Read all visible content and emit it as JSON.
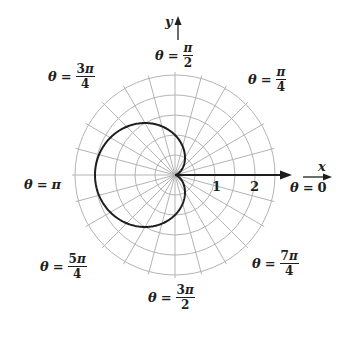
{
  "chart_data": {
    "type": "polar",
    "title": "",
    "equation": "r = 1 - cos(θ)",
    "curve": "cardioid",
    "center_px": [
      175,
      175
    ],
    "scale_px_per_unit": 40,
    "grid": {
      "rings_r": [
        0.5,
        1.0,
        1.5,
        2.0,
        2.5
      ],
      "spoke_step_deg": 15,
      "color": "#b4b4b4"
    },
    "radial_tick_labels": [
      {
        "value": 1,
        "text": "1"
      },
      {
        "value": 2,
        "text": "2"
      }
    ],
    "axes": {
      "x_label": "x",
      "y_label": "y"
    },
    "points": [
      {
        "theta": "0",
        "r": 0
      },
      {
        "theta": "π/2",
        "r": 1
      },
      {
        "theta": "π",
        "r": 2
      },
      {
        "theta": "3π/2",
        "r": 1
      },
      {
        "theta": "2π",
        "r": 0
      }
    ],
    "angle_labels": [
      {
        "id": "t0",
        "angle": "0"
      },
      {
        "id": "t45",
        "angle": "π/4"
      },
      {
        "id": "t90",
        "angle": "π/2"
      },
      {
        "id": "t135",
        "angle": "3π/4"
      },
      {
        "id": "t180",
        "angle": "π"
      },
      {
        "id": "t225",
        "angle": "5π/4"
      },
      {
        "id": "t270",
        "angle": "3π/2"
      },
      {
        "id": "t315",
        "angle": "7π/4"
      }
    ],
    "colors": {
      "curve": "#1e1e1e",
      "axis": "#1e1e1e",
      "grid": "#b4b4b4"
    }
  },
  "labels": {
    "theta": "θ",
    "eq": "=",
    "pi": "π",
    "t0": {
      "value": "0"
    },
    "t45": {
      "num_coef": "",
      "den": "4"
    },
    "t90": {
      "num_coef": "",
      "den": "2"
    },
    "t135": {
      "num_coef": "3",
      "den": "4"
    },
    "t180": {
      "value": "π"
    },
    "t225": {
      "num_coef": "5",
      "den": "4"
    },
    "t270": {
      "num_coef": "3",
      "den": "2"
    },
    "t315": {
      "num_coef": "7",
      "den": "4"
    },
    "tick1": "1",
    "tick2": "2",
    "x": "x",
    "y": "y"
  }
}
